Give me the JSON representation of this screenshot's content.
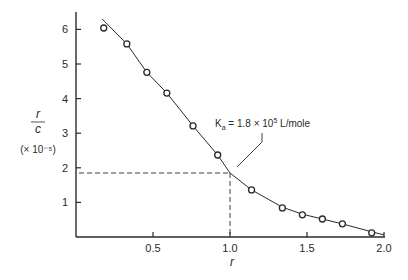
{
  "chart_data": {
    "type": "scatter",
    "title": "",
    "xlabel": "r",
    "ylabel": "r/c",
    "ylabel_numerator": "r",
    "ylabel_denominator": "c",
    "ylabel_unit": "(× 10⁻⁵)",
    "xlim": [
      0,
      2.0
    ],
    "ylim": [
      0,
      6.3
    ],
    "grid": false,
    "x_ticks": [
      0.5,
      1.0,
      1.5,
      2.0
    ],
    "x_tick_labels": [
      "0.5",
      "1.0",
      "1.5",
      "2.0"
    ],
    "y_ticks": [
      1,
      2,
      3,
      4,
      5,
      6
    ],
    "y_tick_labels": [
      "1",
      "2",
      "3",
      "4",
      "5",
      "6"
    ],
    "series": [
      {
        "name": "measured",
        "marker": "open-circle",
        "x": [
          0.18,
          0.33,
          0.46,
          0.59,
          0.76,
          0.92,
          1.14,
          1.34,
          1.47,
          1.6,
          1.73,
          1.92
        ],
        "y": [
          6.04,
          5.58,
          4.76,
          4.16,
          3.21,
          2.37,
          1.36,
          0.84,
          0.64,
          0.52,
          0.38,
          0.12
        ]
      },
      {
        "name": "fitted curve",
        "marker": "line",
        "x": [
          0.17,
          0.33,
          0.46,
          0.59,
          0.76,
          0.92,
          1.0,
          1.14,
          1.34,
          1.47,
          1.6,
          1.73,
          1.92,
          2.0
        ],
        "y": [
          6.3,
          5.58,
          4.76,
          4.16,
          3.21,
          2.37,
          1.85,
          1.36,
          0.86,
          0.66,
          0.52,
          0.38,
          0.15,
          0.06
        ]
      }
    ],
    "reference_lines": [
      {
        "type": "horizontal",
        "y": 1.85,
        "from_x": 0,
        "to_x": 1.0,
        "style": "dashed"
      },
      {
        "type": "vertical",
        "x": 1.0,
        "from_y": 0,
        "to_y": 1.85,
        "style": "dashed"
      }
    ],
    "annotations": [
      {
        "text": "Kₐ = 1.8 × 10⁵ L/mole",
        "points_to": {
          "x": 1.0,
          "y": 1.85
        }
      }
    ]
  },
  "labels": {
    "annotation_prefix": "K",
    "annotation_sub": "a",
    "annotation_body": " = 1.8 × 10",
    "annotation_exp": "5",
    "annotation_suffix": " L/mole"
  },
  "style": {
    "ink": "#2a2a2a",
    "background": "#ffffff"
  }
}
